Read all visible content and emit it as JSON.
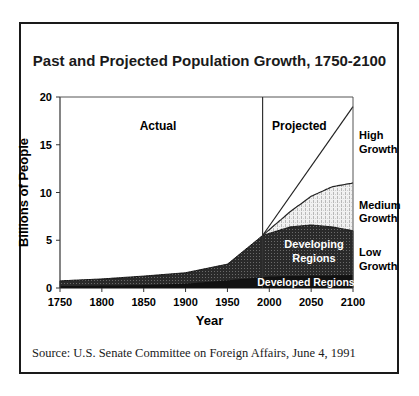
{
  "chart_data": {
    "type": "area",
    "title": "Past and Projected Population Growth, 1750-2100",
    "xlabel": "Year",
    "ylabel": "Billions of People",
    "xlim": [
      1750,
      2100
    ],
    "ylim": [
      0,
      20
    ],
    "xticks": [
      1750,
      1800,
      1850,
      1900,
      1950,
      2000,
      2050,
      2100
    ],
    "yticks": [
      0,
      5,
      10,
      15,
      20
    ],
    "divider_year": 1992,
    "section_labels": [
      "Actual",
      "Projected"
    ],
    "series": [
      {
        "name": "Developed Regions",
        "x": [
          1750,
          1800,
          1850,
          1900,
          1950,
          2000,
          2050,
          2100
        ],
        "values": [
          0.2,
          0.25,
          0.3,
          0.45,
          0.8,
          1.2,
          1.3,
          1.35
        ]
      },
      {
        "name": "Developing Regions (total)",
        "x": [
          1750,
          1800,
          1850,
          1900,
          1950,
          1992,
          2025,
          2050,
          2075,
          2100
        ],
        "values": [
          0.75,
          0.95,
          1.25,
          1.6,
          2.5,
          5.5,
          6.4,
          6.6,
          6.4,
          6.0
        ]
      },
      {
        "name": "Low Growth",
        "x": [
          1992,
          2025,
          2050,
          2075,
          2100
        ],
        "values": [
          5.5,
          6.4,
          6.6,
          6.4,
          6.0
        ]
      },
      {
        "name": "Medium Growth",
        "x": [
          1992,
          2025,
          2050,
          2075,
          2100
        ],
        "values": [
          5.5,
          8.0,
          9.6,
          10.6,
          11.0
        ]
      },
      {
        "name": "High Growth",
        "x": [
          1992,
          2100
        ],
        "values": [
          5.5,
          19.0
        ]
      }
    ],
    "annotations": [
      "Developing Regions",
      "Developed Regions",
      "High Growth",
      "Medium Growth",
      "Low Growth"
    ],
    "source": "Source:  U.S. Senate Committee on Foreign Affairs, June 4, 1991"
  },
  "labels": {
    "actual": "Actual",
    "projected": "Projected",
    "high": [
      "High",
      "Growth"
    ],
    "medium": [
      "Medium",
      "Growth"
    ],
    "low": [
      "Low",
      "Growth"
    ],
    "developing": [
      "Developing",
      "Regions"
    ],
    "developed": "Developed Regions"
  }
}
